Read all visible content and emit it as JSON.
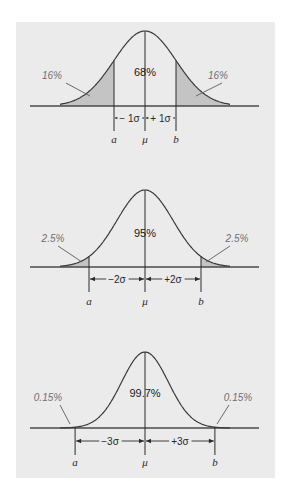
{
  "figure": {
    "panel_color": "#ebebeb",
    "tail_color": "#c4c4c4",
    "curve_color": "#3a3a3a",
    "mu_x": 145
  },
  "chart_data": [
    {
      "type": "area",
      "title": "Normal distribution: within ±1σ",
      "center_label": "68%",
      "left_tail_label": "16%",
      "right_tail_label": "16%",
      "left_sigma_label": "− 1σ",
      "right_sigma_label": "+ 1σ",
      "lower_bound_label": "a",
      "mean_label": "μ",
      "upper_bound_label": "b",
      "sigma_multiple": 1,
      "pct_within": 68,
      "pct_each_tail": 16,
      "geometry": {
        "baseline_y": 106,
        "apex_y": 31,
        "sigma_px": 31,
        "axis_x0": 30,
        "axis_x1": 259,
        "arrow_y": 118,
        "tick_bottom": 131,
        "label_y": 143,
        "left_label_pos": [
          52,
          79
        ],
        "left_arrow": [
          [
            66,
            83
          ],
          [
            90,
            96
          ]
        ],
        "right_label_pos": [
          218,
          79
        ],
        "right_arrow": [
          [
            222,
            83
          ],
          [
            196,
            96
          ]
        ],
        "center_label_pos": [
          145,
          76
        ]
      }
    },
    {
      "type": "area",
      "title": "Normal distribution: within ±2σ",
      "center_label": "95%",
      "left_tail_label": "2.5%",
      "right_tail_label": "2.5%",
      "left_sigma_label": "−2σ",
      "right_sigma_label": "+2σ",
      "lower_bound_label": "a",
      "mean_label": "μ",
      "upper_bound_label": "b",
      "sigma_multiple": 2,
      "pct_within": 95,
      "pct_each_tail": 2.5,
      "geometry": {
        "baseline_y": 267,
        "apex_y": 190,
        "sigma_px": 28,
        "axis_x0": 30,
        "axis_x1": 259,
        "arrow_y": 279,
        "tick_bottom": 292,
        "label_y": 305,
        "left_label_pos": [
          53,
          242
        ],
        "left_arrow": [
          [
            58,
            246
          ],
          [
            82,
            262
          ]
        ],
        "right_label_pos": [
          237,
          242
        ],
        "right_arrow": [
          [
            230,
            246
          ],
          [
            206,
            262
          ]
        ],
        "center_label_pos": [
          145,
          237
        ]
      }
    },
    {
      "type": "area",
      "title": "Normal distribution: within ±3σ",
      "center_label": "99.7%",
      "left_tail_label": "0.15%",
      "right_tail_label": "0.15%",
      "left_sigma_label": "−3σ",
      "right_sigma_label": "+3σ",
      "lower_bound_label": "a",
      "mean_label": "μ",
      "upper_bound_label": "b",
      "sigma_multiple": 3,
      "pct_within": 99.7,
      "pct_each_tail": 0.15,
      "geometry": {
        "baseline_y": 428,
        "apex_y": 352,
        "sigma_px": 23.3,
        "axis_x0": 30,
        "axis_x1": 259,
        "arrow_y": 441,
        "tick_bottom": 455,
        "label_y": 466,
        "left_label_pos": [
          48,
          401
        ],
        "left_arrow": [
          [
            60,
            405
          ],
          [
            70,
            424
          ]
        ],
        "right_label_pos": [
          238,
          401
        ],
        "right_arrow": [
          [
            229,
            405
          ],
          [
            217,
            424
          ]
        ],
        "center_label_pos": [
          145,
          397
        ]
      }
    }
  ]
}
